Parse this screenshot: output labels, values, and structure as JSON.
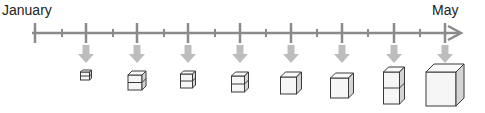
{
  "timeline": {
    "start_label": "January",
    "end_label": "May",
    "axis_color": "#8a8a8a",
    "arrow_color": "#bdbdbd",
    "cube_stroke": "#3a3a3a",
    "cube_face": "#f6f6f6",
    "cube_side": "#d4d4d4",
    "major_ticks_x": [
      35,
      86,
      137,
      188,
      240,
      291,
      342,
      394,
      445
    ],
    "minor_ticks_x": [
      62,
      113,
      164,
      215,
      266,
      317,
      368,
      420
    ]
  },
  "stages": [
    {
      "name": "stage-1",
      "x": 86,
      "cube": {
        "w": 9,
        "h": 8,
        "d": 2,
        "layers": 2,
        "partial": "slab"
      }
    },
    {
      "name": "stage-2",
      "x": 137,
      "cube": {
        "w": 14,
        "h": 15,
        "d": 4,
        "layers": 2,
        "partial": "step"
      }
    },
    {
      "name": "stage-3",
      "x": 188,
      "cube": {
        "w": 12,
        "h": 14,
        "d": 3,
        "layers": 2,
        "partial": "half"
      }
    },
    {
      "name": "stage-4",
      "x": 240,
      "cube": {
        "w": 13,
        "h": 16,
        "d": 4,
        "layers": 2,
        "partial": "nearly-full"
      }
    },
    {
      "name": "stage-5",
      "x": 291,
      "cube": {
        "w": 16,
        "h": 17,
        "d": 5,
        "layers": 1,
        "partial": "full"
      }
    },
    {
      "name": "stage-6",
      "x": 342,
      "cube": {
        "w": 18,
        "h": 20,
        "d": 5,
        "layers": 1,
        "partial": "full"
      }
    },
    {
      "name": "stage-7",
      "x": 394,
      "cube": {
        "w": 16,
        "h": 32,
        "d": 5,
        "layers": 2,
        "partial": "stacked"
      }
    },
    {
      "name": "stage-8",
      "x": 445,
      "cube": {
        "w": 30,
        "h": 34,
        "d": 8,
        "layers": 1,
        "partial": "large"
      }
    }
  ]
}
